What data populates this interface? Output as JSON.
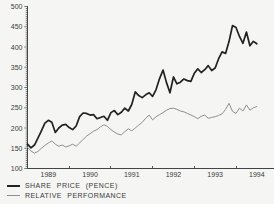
{
  "chart_data": {
    "type": "line",
    "title": "",
    "x_start_year": 1989,
    "points_per_year": 12,
    "x_tick_labels": [
      "1989",
      "1990",
      "1991",
      "1992",
      "1993",
      "1994"
    ],
    "y_tick_labels": [
      "100",
      "150",
      "200",
      "250",
      "300",
      "350",
      "400",
      "450",
      "500"
    ],
    "y_ticks": [
      100,
      150,
      200,
      250,
      300,
      350,
      400,
      450,
      500
    ],
    "ylim": [
      100,
      500
    ],
    "grid": false,
    "legend_position": "bottom-left",
    "series": [
      {
        "name": "SHARE PRICE (PENCE)",
        "color": "#222222",
        "stroke_width": 1.7,
        "values": [
          160,
          151,
          158,
          175,
          193,
          212,
          219,
          214,
          189,
          200,
          207,
          209,
          201,
          196,
          205,
          228,
          237,
          236,
          232,
          233,
          223,
          226,
          229,
          219,
          238,
          243,
          233,
          239,
          249,
          242,
          258,
          289,
          280,
          275,
          282,
          287,
          278,
          295,
          322,
          343,
          312,
          287,
          326,
          309,
          313,
          321,
          317,
          315,
          335,
          346,
          337,
          344,
          354,
          342,
          348,
          371,
          388,
          384,
          414,
          453,
          448,
          426,
          409,
          437,
          403,
          414,
          408
        ]
      },
      {
        "name": "RELATIVE PERFORMANCE",
        "color": "#8f8f8f",
        "stroke_width": 1,
        "values": [
          152,
          143,
          138,
          142,
          150,
          157,
          163,
          168,
          160,
          155,
          158,
          153,
          156,
          160,
          155,
          163,
          172,
          180,
          186,
          192,
          196,
          203,
          208,
          204,
          196,
          190,
          185,
          183,
          191,
          198,
          193,
          200,
          207,
          214,
          224,
          232,
          220,
          228,
          233,
          238,
          244,
          248,
          249,
          246,
          242,
          240,
          236,
          232,
          228,
          223,
          229,
          232,
          224,
          226,
          228,
          231,
          235,
          246,
          261,
          241,
          236,
          249,
          242,
          257,
          244,
          250,
          253
        ]
      }
    ]
  },
  "legend": {
    "items": [
      {
        "label": "SHARE PRICE (PENCE)"
      },
      {
        "label": "RELATIVE PERFORMANCE"
      }
    ]
  },
  "colors": {
    "background": "#f5f5f3",
    "axis": "#444444",
    "text": "#3a3a3a",
    "share_price_line": "#222222",
    "relative_performance_line": "#8f8f8f"
  }
}
